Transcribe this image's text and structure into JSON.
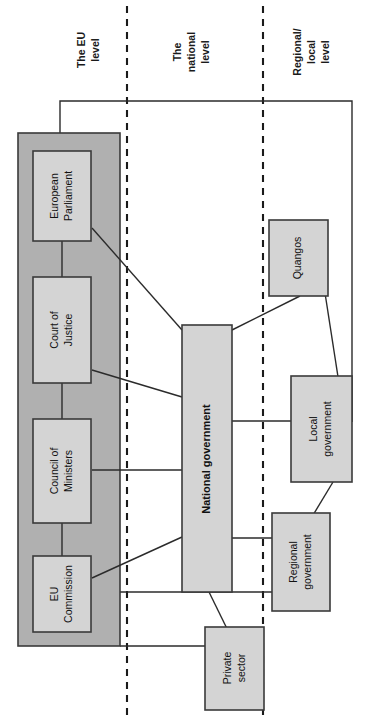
{
  "figure": {
    "orientation": "rotated-90-ccw",
    "background_color": "#ffffff",
    "panel_color": "#b0b0b0",
    "node_color": "#d4d4d4",
    "line_color": "#2b2b2b"
  },
  "column_labels": [
    {
      "id": "eu-level",
      "lines": [
        "The EU",
        "level"
      ]
    },
    {
      "id": "national-level",
      "lines": [
        "The",
        "national",
        "level"
      ]
    },
    {
      "id": "regional-local-level",
      "lines": [
        "Regional/",
        "local",
        "level"
      ]
    }
  ],
  "panels": [
    {
      "id": "eu-panel",
      "label": ""
    }
  ],
  "nodes": [
    {
      "id": "european-parliament",
      "lines": [
        "European",
        "Parliament"
      ],
      "bold": false,
      "group": "eu"
    },
    {
      "id": "court-of-justice",
      "lines": [
        "Court of",
        "Justice"
      ],
      "bold": false,
      "group": "eu"
    },
    {
      "id": "council-of-ministers",
      "lines": [
        "Council of",
        "Ministers"
      ],
      "bold": false,
      "group": "eu"
    },
    {
      "id": "eu-commission",
      "lines": [
        "EU",
        "Commission"
      ],
      "bold": false,
      "group": "eu"
    },
    {
      "id": "national-government",
      "lines": [
        "National government"
      ],
      "bold": true,
      "group": "national"
    },
    {
      "id": "quangos",
      "lines": [
        "Quangos"
      ],
      "bold": false,
      "group": "regional"
    },
    {
      "id": "local-government",
      "lines": [
        "Local",
        "government"
      ],
      "bold": false,
      "group": "regional"
    },
    {
      "id": "regional-government",
      "lines": [
        "Regional",
        "government"
      ],
      "bold": false,
      "group": "regional"
    },
    {
      "id": "private-sector",
      "lines": [
        "Private",
        "sector"
      ],
      "bold": false,
      "group": "national"
    }
  ],
  "connections": [
    {
      "from": "eu-panel",
      "to": "local-government",
      "style": "orthogonal"
    },
    {
      "from": "european-parliament",
      "to": "court-of-justice",
      "style": "straight"
    },
    {
      "from": "court-of-justice",
      "to": "council-of-ministers",
      "style": "straight"
    },
    {
      "from": "council-of-ministers",
      "to": "eu-commission",
      "style": "straight"
    },
    {
      "from": "european-parliament",
      "to": "national-government",
      "style": "straight"
    },
    {
      "from": "court-of-justice",
      "to": "national-government",
      "style": "straight"
    },
    {
      "from": "council-of-ministers",
      "to": "national-government",
      "style": "straight"
    },
    {
      "from": "eu-commission",
      "to": "national-government",
      "style": "straight"
    },
    {
      "from": "national-government",
      "to": "quangos",
      "style": "straight"
    },
    {
      "from": "national-government",
      "to": "local-government",
      "style": "straight"
    },
    {
      "from": "national-government",
      "to": "regional-government",
      "style": "straight"
    },
    {
      "from": "national-government",
      "to": "private-sector",
      "style": "straight"
    },
    {
      "from": "quangos",
      "to": "local-government",
      "style": "straight"
    },
    {
      "from": "local-government",
      "to": "regional-government",
      "style": "straight"
    },
    {
      "from": "eu-panel",
      "to": "regional-government",
      "style": "straight"
    },
    {
      "from": "eu-panel",
      "to": "private-sector",
      "style": "straight"
    }
  ]
}
